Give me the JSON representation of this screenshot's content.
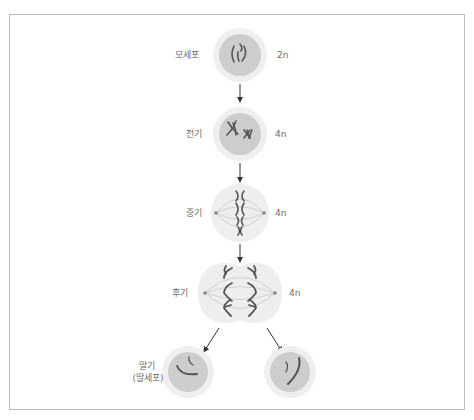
{
  "diagram": {
    "title": "",
    "stages": [
      {
        "id": "mother",
        "label": "모세포",
        "ploidy": "2n"
      },
      {
        "id": "prophase",
        "label": "전기",
        "ploidy": "4n"
      },
      {
        "id": "metaphase",
        "label": "중기",
        "ploidy": "4n"
      },
      {
        "id": "anaphase",
        "label": "후기",
        "ploidy": "4n"
      },
      {
        "id": "daughter",
        "label": "말기",
        "sublabel": "(딸세포)",
        "ploidy": ""
      }
    ],
    "colors": {
      "cell_outer": "#ececec",
      "cell_inner": "#cfcfcf",
      "spindle_cell": "#eeeeee",
      "chromosome": "#5a5a5a",
      "arrow": "#333333",
      "label": "#6b6b6b",
      "frame": "#bdbdbd"
    }
  }
}
